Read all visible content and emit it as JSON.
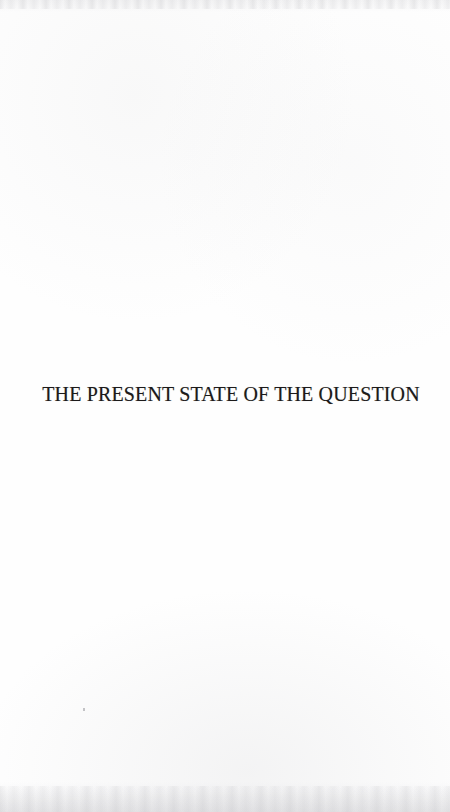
{
  "page": {
    "kind": "scanned-book-page",
    "background_color": "#fefefe",
    "ink_color": "#1c1a1a",
    "width": 450,
    "height": 812
  },
  "content": {
    "heading": "THE PRESENT STATE OF THE QUESTION"
  },
  "artifacts": {
    "top_edge_shading": "faint grey mottling along top edge",
    "bottom_edge_shading": "faint grey mottling along bottom edge",
    "dust_speck": "small grey speck in lower-left area"
  }
}
